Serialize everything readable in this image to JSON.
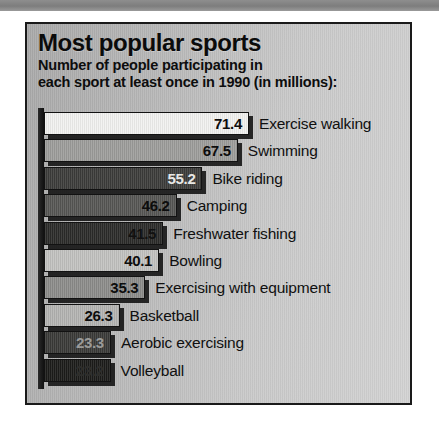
{
  "chart_data": {
    "type": "bar",
    "orientation": "horizontal",
    "title": "Most popular sports",
    "subtitle_line1": "Number of people participating in",
    "subtitle_line2": "each sport at least once in 1990 (in millions):",
    "xlabel": "",
    "ylabel": "",
    "unit": "millions of people",
    "year": 1990,
    "xlim": [
      0,
      71.4
    ],
    "grid": false,
    "legend": "none",
    "categories": [
      "Exercise walking",
      "Swimming",
      "Bike riding",
      "Camping",
      "Freshwater fishing",
      "Bowling",
      "Exercising with equipment",
      "Basketball",
      "Aerobic exercising",
      "Volleyball"
    ],
    "values": [
      71.4,
      67.5,
      55.2,
      46.2,
      41.5,
      40.1,
      35.3,
      26.3,
      23.3,
      23.2
    ],
    "value_labels": [
      "71.4",
      "67.5",
      "55.2",
      "46.2",
      "41.5",
      "40.1",
      "35.3",
      "26.3",
      "23.3",
      "23.2"
    ],
    "bars": [
      {
        "label": "Exercise walking",
        "value": 71.4,
        "value_label": "71.4",
        "fill": "#f2f2f0",
        "text": "#0d0d0d"
      },
      {
        "label": "Swimming",
        "value": 67.5,
        "value_label": "67.5",
        "fill": "#9d9d9b",
        "text": "#0d0d0d"
      },
      {
        "label": "Bike riding",
        "value": 55.2,
        "value_label": "55.2",
        "fill": "#3c3c3a",
        "text": "#e8e8e6"
      },
      {
        "label": "Camping",
        "value": 46.2,
        "value_label": "46.2",
        "fill": "#565654",
        "text": "#0d0d0d"
      },
      {
        "label": "Freshwater fishing",
        "value": 41.5,
        "value_label": "41.5",
        "fill": "#2b2b29",
        "text": "#111111"
      },
      {
        "label": "Bowling",
        "value": 40.1,
        "value_label": "40.1",
        "fill": "#c2c2c0",
        "text": "#0d0d0d"
      },
      {
        "label": "Exercising with equipment",
        "value": 35.3,
        "value_label": "35.3",
        "fill": "#8c8c8a",
        "text": "#0d0d0d"
      },
      {
        "label": "Basketball",
        "value": 26.3,
        "value_label": "26.3",
        "fill": "#b4b4b2",
        "text": "#0d0d0d"
      },
      {
        "label": "Aerobic exercising",
        "value": 23.3,
        "value_label": "23.3",
        "fill": "#3a3a38",
        "text": "#9a9a98"
      },
      {
        "label": "Volleyball",
        "value": 23.2,
        "value_label": "23.2",
        "fill": "#1c1c1a",
        "text": "#2e2e2c"
      }
    ],
    "colors": {
      "panel_background": "#c0c0c0",
      "panel_border": "#1a1a1a",
      "top_band": "#7d7d7d",
      "text": "#0d0d0d",
      "shadow": "#0a0a0a"
    }
  }
}
